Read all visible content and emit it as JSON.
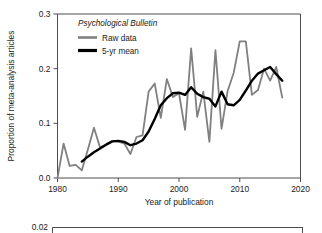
{
  "figure": {
    "background_color": "#ffffff",
    "axis_color": "#4d4d4d",
    "text_color": "#1a1a1a"
  },
  "chart_data": {
    "type": "line",
    "title": "",
    "legend_title": "Psychological Bulletin",
    "xlabel": "Year of publication",
    "ylabel": "Proportion of meta-analysis articles",
    "xlim": [
      1980,
      2020
    ],
    "ylim": [
      0.0,
      0.3
    ],
    "xticks": [
      1980,
      1990,
      2000,
      2010,
      2020
    ],
    "xtick_labels": [
      "1980",
      "1990",
      "2000",
      "2010",
      "2020"
    ],
    "yticks": [
      0.0,
      0.1,
      0.2,
      0.3
    ],
    "ytick_labels": [
      "0.0",
      "0.1",
      "0.2",
      "0.3"
    ],
    "grid": false,
    "legend_position": "top-left",
    "colors": {
      "raw_data": "#808080",
      "five_yr_mean": "#000000"
    },
    "x": [
      1980,
      1981,
      1982,
      1983,
      1984,
      1985,
      1986,
      1987,
      1988,
      1989,
      1990,
      1991,
      1992,
      1993,
      1994,
      1995,
      1996,
      1997,
      1998,
      1999,
      2000,
      2001,
      2002,
      2003,
      2004,
      2005,
      2006,
      2007,
      2008,
      2009,
      2010,
      2011,
      2012,
      2013,
      2014,
      2015,
      2016,
      2017
    ],
    "series": [
      {
        "name": "Raw data",
        "color": "#808080",
        "line_width": 1.8,
        "values": [
          0.0,
          0.063,
          0.022,
          0.024,
          0.014,
          0.052,
          0.092,
          0.056,
          0.061,
          0.067,
          0.067,
          0.063,
          0.044,
          0.075,
          0.078,
          0.158,
          0.173,
          0.11,
          0.181,
          0.148,
          0.155,
          0.088,
          0.237,
          0.112,
          0.158,
          0.066,
          0.234,
          0.09,
          0.159,
          0.192,
          0.25,
          0.25,
          0.152,
          0.161,
          0.2,
          0.178,
          0.203,
          0.147
        ]
      },
      {
        "name": "5-yr mean",
        "color": "#000000",
        "line_width": 2.4,
        "values": [
          null,
          null,
          null,
          null,
          0.03,
          0.039,
          0.047,
          0.054,
          0.061,
          0.067,
          0.068,
          0.066,
          0.06,
          0.063,
          0.069,
          0.085,
          0.108,
          0.133,
          0.146,
          0.155,
          0.156,
          0.152,
          0.166,
          0.154,
          0.148,
          0.145,
          0.131,
          0.158,
          0.135,
          0.133,
          0.143,
          0.16,
          0.178,
          0.191,
          0.197,
          0.203,
          0.19,
          0.178
        ]
      }
    ],
    "legend_entries": [
      {
        "label": "Raw data",
        "color": "#808080"
      },
      {
        "label": "5-yr mean",
        "color": "#000000"
      }
    ]
  },
  "secondary_panel": {
    "visible_ytick_label": "0.02",
    "description": "top edge of a second clipped plot panel"
  }
}
